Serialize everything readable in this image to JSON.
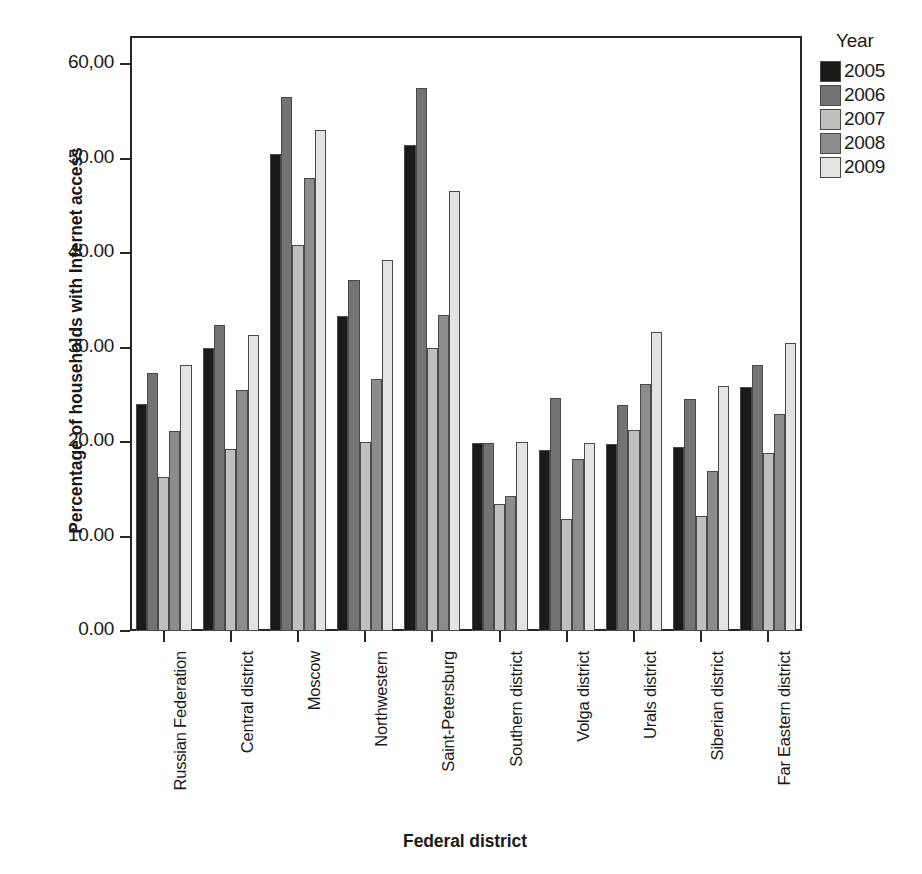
{
  "chart_data": {
    "type": "bar",
    "title": "",
    "xlabel": "Federal district",
    "ylabel": "Percentage of households with Internet access",
    "ylim": [
      0,
      63
    ],
    "grid": false,
    "legend_position": "right",
    "legend_title": "Year",
    "ytick_labels": [
      "0.00",
      "10.00",
      "20.00",
      "30.00",
      "40.00",
      "50.00",
      "60,00"
    ],
    "ytick_values": [
      0,
      10,
      20,
      30,
      40,
      50,
      60
    ],
    "categories": [
      "Russian Federation",
      "Central district",
      "Moscow",
      "Northwestern",
      "Saint-Petersburg",
      "Southern district",
      "Volga district",
      "Urals district",
      "Siberian district",
      "Far Eastern district"
    ],
    "series": [
      {
        "name": "2005",
        "color": "#1a1a1a",
        "values": [
          24.0,
          30.0,
          50.5,
          33.4,
          51.5,
          19.9,
          19.2,
          19.8,
          19.5,
          25.8
        ]
      },
      {
        "name": "2006",
        "color": "#737373",
        "values": [
          27.3,
          32.4,
          56.5,
          37.2,
          57.5,
          19.9,
          24.7,
          23.9,
          24.6,
          28.2
        ]
      },
      {
        "name": "2007",
        "color": "#bfbfbf",
        "values": [
          16.3,
          19.3,
          40.9,
          20.0,
          30.0,
          13.5,
          11.9,
          21.3,
          12.2,
          18.9
        ]
      },
      {
        "name": "2008",
        "color": "#8c8c8c",
        "values": [
          21.2,
          25.5,
          48.0,
          26.7,
          33.5,
          14.3,
          18.2,
          26.2,
          16.9,
          23.0
        ]
      },
      {
        "name": "2009",
        "color": "#e3e3e3",
        "values": [
          28.2,
          31.3,
          53.0,
          39.3,
          46.6,
          20.0,
          19.9,
          31.7,
          25.9,
          30.5
        ]
      }
    ]
  }
}
